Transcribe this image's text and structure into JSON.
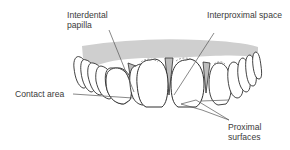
{
  "figure": {
    "colors": {
      "gingiva": "#cfcfcf",
      "tooth_fill": "#ffffff",
      "outline": "#2e2e2e",
      "leader_line": "#555555",
      "label_text": "#3a3a3a"
    }
  },
  "labels": {
    "interdental_papilla": {
      "line1": "Interdental",
      "line2": "papilla"
    },
    "interproximal_space": {
      "text": "Interproximal space"
    },
    "contact_area": {
      "text": "Contact area"
    },
    "proximal_surfaces": {
      "line1": "Proximal",
      "line2": "surfaces"
    }
  }
}
